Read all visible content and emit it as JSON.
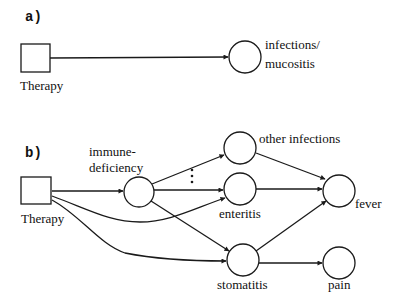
{
  "diagram": {
    "panel_a": {
      "label": "a)",
      "nodes": {
        "therapy": {
          "label": "Therapy",
          "shape": "square"
        },
        "infections": {
          "label_line1": "infections/",
          "label_line2": "mucositis",
          "shape": "circle"
        }
      },
      "edges": [
        {
          "from": "Therapy",
          "to": "infections/mucositis"
        }
      ]
    },
    "panel_b": {
      "label": "b)",
      "ellipsis": "⋮",
      "nodes": {
        "therapy": {
          "label": "Therapy",
          "shape": "square"
        },
        "immunedeficiency": {
          "label_line1": "immune-",
          "label_line2": "deficiency",
          "shape": "circle"
        },
        "other_infections": {
          "label": "other infections",
          "shape": "circle"
        },
        "enteritis": {
          "label": "enteritis",
          "shape": "circle"
        },
        "stomatitis": {
          "label": "stomatitis",
          "shape": "circle"
        },
        "fever": {
          "label": "fever",
          "shape": "circle"
        },
        "pain": {
          "label": "pain",
          "shape": "circle"
        }
      },
      "edges": [
        {
          "from": "Therapy",
          "to": "immune-deficiency"
        },
        {
          "from": "Therapy",
          "to": "enteritis"
        },
        {
          "from": "Therapy",
          "to": "stomatitis"
        },
        {
          "from": "immune-deficiency",
          "to": "other infections"
        },
        {
          "from": "immune-deficiency",
          "to": "enteritis"
        },
        {
          "from": "immune-deficiency",
          "to": "stomatitis"
        },
        {
          "from": "other infections",
          "to": "fever"
        },
        {
          "from": "enteritis",
          "to": "fever"
        },
        {
          "from": "stomatitis",
          "to": "fever"
        },
        {
          "from": "stomatitis",
          "to": "pain"
        }
      ]
    },
    "colors": {
      "stroke": "#1a1a1a",
      "background": "#ffffff"
    }
  }
}
